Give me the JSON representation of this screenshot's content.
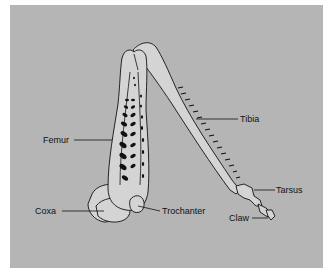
{
  "diagram": {
    "colors": {
      "background": "#ffffff",
      "panel": "#b5b5b5",
      "leg_fill": "#d4d4d4",
      "outline": "#111111",
      "muscle": "#111111"
    },
    "labels": {
      "femur": "Femur",
      "tibia": "Tibia",
      "tarsus": "Tarsus",
      "claw": "Claw",
      "coxa": "Coxa",
      "trochanter": "Trochanter"
    }
  }
}
